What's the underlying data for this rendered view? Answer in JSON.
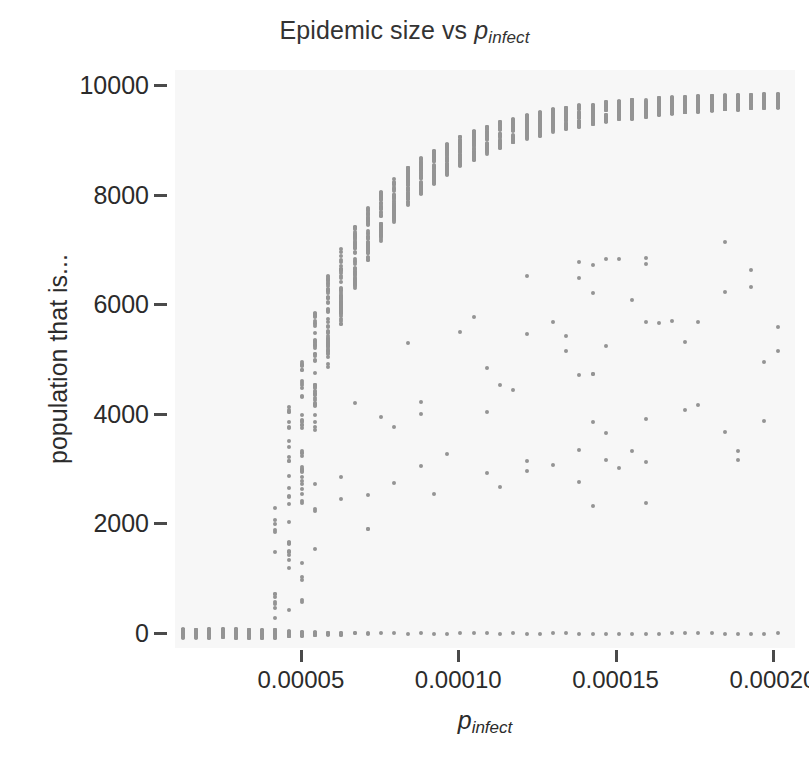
{
  "chart_data": {
    "type": "scatter",
    "title_main": "Epidemic size vs ",
    "title_var": "p",
    "title_sub": "infect",
    "xlabel": "p_infect",
    "xlabel_var": "p",
    "xlabel_sub": "infect",
    "ylabel": "population that is...",
    "xlim": [
      1e-05,
      0.000207
    ],
    "ylim": [
      -260,
      10300
    ],
    "xticks": [
      5e-05,
      0.0001,
      0.00015,
      0.0002
    ],
    "xtick_labels": [
      "0.00005",
      "0.00010",
      "0.00015",
      "0.00020"
    ],
    "yticks": [
      0,
      2000,
      4000,
      6000,
      8000,
      10000
    ],
    "ytick_labels": [
      "0",
      "2000",
      "4000",
      "6000",
      "8000",
      "10000"
    ],
    "grid": false,
    "legend": false,
    "marker_color": "#949494",
    "marker_size": 4,
    "plot_background": "#f7f7f7",
    "figure_background": "#ffffff",
    "series": [
      {
        "name": "simulation replicates",
        "x_values": [
          1.25e-05,
          1.67e-05,
          2.09e-05,
          2.51e-05,
          2.93e-05,
          3.35e-05,
          3.77e-05,
          4.19e-05,
          4.61e-05,
          5.03e-05,
          5.45e-05,
          5.87e-05,
          6.29e-05,
          6.71e-05,
          7.13e-05,
          7.55e-05,
          7.97e-05,
          8.39e-05,
          8.81e-05,
          9.23e-05,
          9.65e-05,
          0.0001007,
          0.0001049,
          0.0001091,
          0.0001133,
          0.0001175,
          0.0001217,
          0.0001259,
          0.0001301,
          0.0001343,
          0.0001385,
          0.0001427,
          0.0001469,
          0.0001511,
          0.0001553,
          0.0001595,
          0.0001637,
          0.0001679,
          0.0001721,
          0.0001763,
          0.0001805,
          0.0001847,
          0.0001889,
          0.0001931,
          0.0001973,
          0.0002015
        ],
        "epidemic_branch_median": [
          0,
          0,
          0,
          0,
          0,
          0,
          0,
          900,
          2050,
          3400,
          4550,
          5450,
          6150,
          6700,
          7150,
          7500,
          7800,
          8050,
          8250,
          8420,
          8570,
          8700,
          8810,
          8910,
          9000,
          9080,
          9150,
          9210,
          9265,
          9315,
          9360,
          9400,
          9435,
          9465,
          9495,
          9520,
          9545,
          9565,
          9585,
          9600,
          9615,
          9630,
          9640,
          9648,
          9655,
          9660
        ],
        "epidemic_branch_low": [
          0,
          0,
          0,
          0,
          0,
          0,
          0,
          150,
          900,
          2300,
          3700,
          4750,
          5600,
          6250,
          6750,
          7150,
          7480,
          7760,
          7990,
          8190,
          8360,
          8510,
          8640,
          8750,
          8850,
          8940,
          9020,
          9090,
          9150,
          9205,
          9255,
          9300,
          9340,
          9375,
          9408,
          9437,
          9463,
          9487,
          9508,
          9527,
          9544,
          9559,
          9573,
          9585,
          9595,
          9604
        ],
        "epidemic_branch_high": [
          0,
          0,
          0,
          0,
          0,
          0,
          0,
          2450,
          4150,
          5200,
          5950,
          6550,
          7050,
          7450,
          7790,
          8070,
          8310,
          8510,
          8690,
          8840,
          8970,
          9090,
          9190,
          9280,
          9355,
          9425,
          9485,
          9540,
          9585,
          9625,
          9660,
          9690,
          9715,
          9738,
          9758,
          9775,
          9790,
          9803,
          9815,
          9825,
          9834,
          9842,
          9849,
          9855,
          9860,
          9865
        ],
        "fraction_extinct": [
          1.0,
          1.0,
          1.0,
          1.0,
          1.0,
          1.0,
          0.97,
          0.78,
          0.52,
          0.3,
          0.17,
          0.1,
          0.06,
          0.04,
          0.03,
          0.02,
          0.02,
          0.015,
          0.012,
          0.01,
          0.01,
          0.008,
          0.007,
          0.006,
          0.005,
          0.005,
          0.004,
          0.004,
          0.003,
          0.003,
          0.003,
          0.002,
          0.002,
          0.002,
          0.002,
          0.002,
          0.001,
          0.001,
          0.001,
          0.001,
          0.001,
          0.001,
          0.001,
          0.001,
          0.001,
          0.001
        ]
      }
    ]
  }
}
